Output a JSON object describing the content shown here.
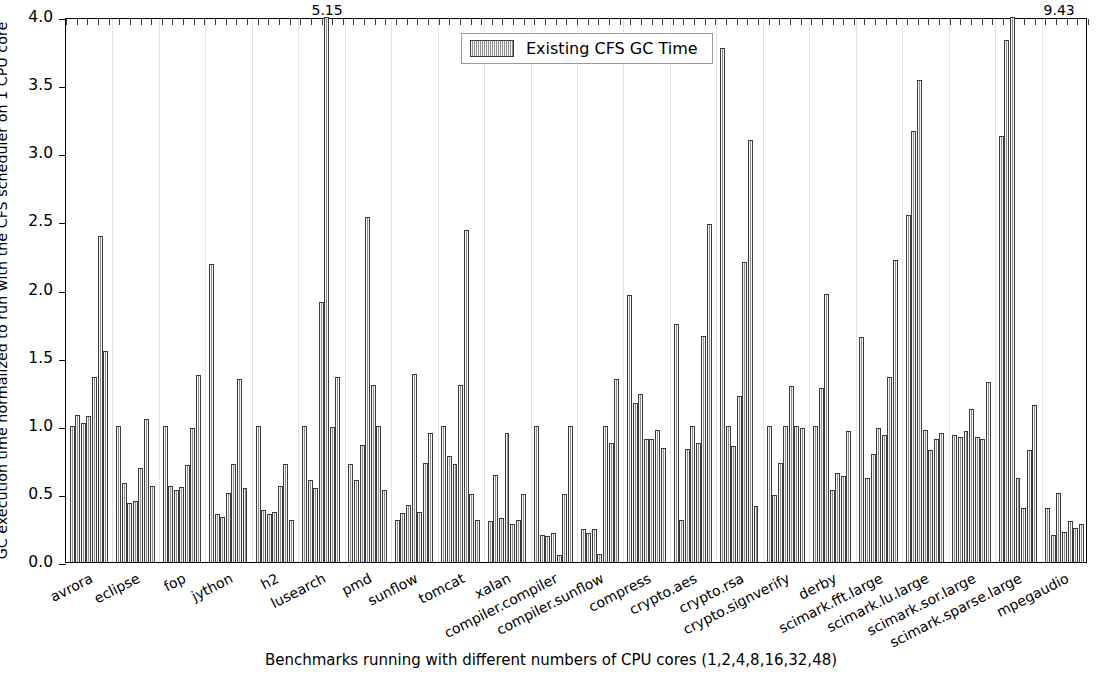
{
  "chart_data": {
    "type": "bar",
    "title": "",
    "xlabel": "Benchmarks running with different numbers of CPU cores (1,2,4,8,16,32,48)",
    "ylabel": "GC execution time normalized to run with the CFS scheduler on 1 CPU core",
    "ylim": [
      0,
      4.0
    ],
    "yticks": [
      "0.0",
      "0.5",
      "1.0",
      "1.5",
      "2.0",
      "2.5",
      "3.0",
      "3.5",
      "4.0"
    ],
    "ytick_values": [
      0,
      0.5,
      1.0,
      1.5,
      2.0,
      2.5,
      3.0,
      3.5,
      4.0
    ],
    "grid": "vertical",
    "legend_position": "upper center",
    "legend": [
      "Existing CFS GC Time"
    ],
    "series_name": "Existing CFS GC Time",
    "bars_per_group": 7,
    "core_counts": [
      1,
      2,
      4,
      8,
      16,
      32,
      48
    ],
    "categories": [
      "avrora",
      "eclipse",
      "fop",
      "jython",
      "h2",
      "lusearch",
      "pmd",
      "sunflow",
      "tomcat",
      "xalan",
      "compiler.compiler",
      "compiler.sunflow",
      "compress",
      "crypto.aes",
      "crypto.rsa",
      "crypto.signverify",
      "derby",
      "scimark.fft.large",
      "scimark.lu.large",
      "scimark.sor.large",
      "scimark.sparse.large",
      "mpegaudio",
      "xml.transform",
      "xml.validation"
    ],
    "groups": [
      {
        "name": "avrora",
        "values": [
          1.0,
          1.08,
          1.02,
          1.07,
          1.36,
          2.39,
          1.55
        ]
      },
      {
        "name": "eclipse",
        "values": [
          1.0,
          0.58,
          0.43,
          0.45,
          0.69,
          1.05,
          0.56
        ]
      },
      {
        "name": "fop",
        "values": [
          1.0,
          0.56,
          0.53,
          0.55,
          0.71,
          0.98,
          1.37
        ]
      },
      {
        "name": "jython",
        "values": [
          2.19,
          0.35,
          0.33,
          0.51,
          0.72,
          1.34,
          0.54
        ]
      },
      {
        "name": "h2",
        "values": [
          1.0,
          0.38,
          0.35,
          0.37,
          0.56,
          0.72,
          0.31
        ]
      },
      {
        "name": "lusearch",
        "values": [
          1.0,
          0.6,
          0.54,
          1.91,
          5.15,
          0.99,
          1.36
        ]
      },
      {
        "name": "pmd",
        "values": [
          0.72,
          0.6,
          0.86,
          2.53,
          1.3,
          1.0,
          0.53
        ]
      },
      {
        "name": "sunflow",
        "values": [
          0.31,
          0.36,
          0.42,
          1.38,
          0.37,
          0.73,
          0.95
        ]
      },
      {
        "name": "tomcat",
        "values": [
          1.0,
          0.78,
          0.72,
          1.3,
          2.44,
          0.5,
          0.31
        ]
      },
      {
        "name": "xalan",
        "values": [
          0.3,
          0.64,
          0.32,
          0.95,
          0.28,
          0.31,
          0.5
        ]
      },
      {
        "name": "compiler.compiler",
        "values": [
          1.0,
          0.2,
          0.19,
          0.21,
          0.05,
          0.5,
          1.0
        ]
      },
      {
        "name": "compiler.sunflow",
        "values": [
          0.24,
          0.21,
          0.24,
          0.06,
          1.0,
          0.87,
          1.34
        ]
      },
      {
        "name": "compress",
        "values": [
          1.96,
          1.17,
          1.23,
          0.9,
          0.9,
          0.97,
          0.84
        ]
      },
      {
        "name": "crypto.aes",
        "values": [
          1.75,
          0.31,
          0.83,
          1.0,
          0.87,
          1.66,
          2.48
        ]
      },
      {
        "name": "crypto.rsa",
        "values": [
          3.77,
          1.0,
          0.85,
          1.22,
          2.2,
          3.1,
          0.41
        ]
      },
      {
        "name": "crypto.signverify",
        "values": [
          1.0,
          0.49,
          0.73,
          1.0,
          1.29,
          1.0,
          0.98
        ]
      },
      {
        "name": "derby",
        "values": [
          1.0,
          1.28,
          1.97,
          0.53,
          0.65,
          0.63,
          0.96
        ]
      },
      {
        "name": "scimark.fft.large",
        "values": [
          1.65,
          0.62,
          0.79,
          0.98,
          0.93,
          1.36,
          2.22
        ]
      },
      {
        "name": "scimark.lu.large",
        "values": [
          2.55,
          3.16,
          3.54,
          0.97,
          0.82,
          0.9,
          0.95
        ]
      },
      {
        "name": "scimark.sor.large",
        "values": [
          0.93,
          0.92,
          0.96,
          1.12,
          0.92,
          0.9,
          1.32
        ]
      },
      {
        "name": "scimark.sparse.large",
        "values": [
          3.13,
          3.83,
          9.43,
          0.62,
          0.4,
          0.82,
          1.15
        ]
      },
      {
        "name": "mpegaudio",
        "values": [
          0.4,
          0.2,
          0.51,
          0.22,
          0.3,
          0.25,
          0.28
        ]
      }
    ],
    "annotations": [
      {
        "text": "5.15",
        "group": 5,
        "bar": 4
      },
      {
        "text": "9.43",
        "group": 21,
        "bar": 2
      }
    ],
    "colors": {
      "bar_fill": "#b9b9b9",
      "bar_edge": "#3b3b3b",
      "grid": "#e3e3e3",
      "axis": "#000000",
      "background": "#ffffff"
    }
  }
}
